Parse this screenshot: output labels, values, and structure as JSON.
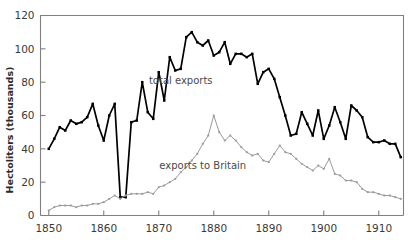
{
  "chart_data": {
    "type": "line",
    "title": "",
    "xlabel": "",
    "ylabel": "Hectoliters (thousands)",
    "xlim": [
      1848.5,
      1914.5
    ],
    "ylim": [
      0,
      120
    ],
    "grid": false,
    "legend_position": "inline-annotations",
    "x_ticks": [
      1850,
      1860,
      1870,
      1880,
      1890,
      1900,
      1910
    ],
    "x_tick_labels": [
      "1850",
      "1860",
      "1870",
      "1880",
      "1890",
      "1900",
      "1910"
    ],
    "y_ticks": [
      0,
      20,
      40,
      60,
      80,
      100,
      120
    ],
    "y_tick_labels": [
      "0",
      "20",
      "40",
      "60",
      "80",
      "100",
      "120"
    ],
    "x": [
      1850,
      1851,
      1852,
      1853,
      1854,
      1855,
      1856,
      1857,
      1858,
      1859,
      1860,
      1861,
      1862,
      1863,
      1864,
      1865,
      1866,
      1867,
      1868,
      1869,
      1870,
      1871,
      1872,
      1873,
      1874,
      1875,
      1876,
      1877,
      1878,
      1879,
      1880,
      1881,
      1882,
      1883,
      1884,
      1885,
      1886,
      1887,
      1888,
      1889,
      1890,
      1891,
      1892,
      1893,
      1894,
      1895,
      1896,
      1897,
      1898,
      1899,
      1900,
      1901,
      1902,
      1903,
      1904,
      1905,
      1906,
      1907,
      1908,
      1909,
      1910,
      1911,
      1912,
      1913,
      1914
    ],
    "series": [
      {
        "name": "total exports",
        "color": "#000000",
        "style": "thick-black-line-with-markers",
        "values": [
          40,
          46,
          53,
          51,
          57,
          55,
          56,
          59,
          67,
          54,
          45,
          60,
          67,
          11,
          11,
          56,
          57,
          80,
          62,
          58,
          86,
          69,
          95,
          87,
          88,
          107,
          110,
          104,
          102,
          105,
          96,
          98,
          104,
          91,
          97,
          97,
          95,
          97,
          79,
          86,
          88,
          82,
          71,
          60,
          48,
          49,
          62,
          55,
          48,
          63,
          46,
          54,
          65,
          56,
          46,
          66,
          63,
          59,
          47,
          44,
          44,
          45,
          43,
          43,
          35
        ]
      },
      {
        "name": "exports to Britain",
        "color": "#9a9a9a",
        "style": "thin-gray-line-with-markers",
        "values": [
          3,
          5,
          6,
          6,
          6,
          5,
          6,
          6,
          7,
          7,
          8,
          10,
          12,
          10,
          12,
          13,
          13,
          13,
          14,
          13,
          17,
          18,
          20,
          22,
          26,
          29,
          33,
          37,
          43,
          48,
          60,
          50,
          45,
          48,
          45,
          41,
          38,
          36,
          37,
          33,
          32,
          37,
          42,
          38,
          37,
          34,
          31,
          29,
          27,
          30,
          28,
          34,
          25,
          24,
          21,
          21,
          20,
          16,
          14,
          14,
          13,
          12,
          12,
          11,
          10
        ]
      }
    ],
    "annotations": [
      {
        "text": "total exports",
        "x": 1874,
        "y": 79
      },
      {
        "text": "exports to Britain",
        "x": 1878,
        "y": 28
      }
    ]
  },
  "figure": {
    "background_color": "#ffffff",
    "axis_color": "#808080",
    "tick_color": "#808080"
  }
}
